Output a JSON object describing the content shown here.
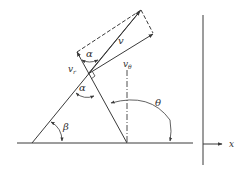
{
  "diagram": {
    "title": "",
    "colors": {
      "stroke": "#3a3a3a",
      "text": "#333333",
      "background": "#ffffff"
    },
    "labels": {
      "v": "v",
      "vr": "v",
      "vr_sub": "r",
      "vtheta": "v",
      "vtheta_sub": "θ",
      "alpha_top": "α",
      "alpha_mid": "α",
      "theta": "θ",
      "beta": "β",
      "x": "x"
    },
    "elements": [
      "ground-line",
      "inclined-line-beta",
      "radial-line",
      "velocity-v",
      "velocity-vr",
      "velocity-vtheta",
      "dashed-parallelogram",
      "vertical-dashdot-line",
      "right-angle-marker",
      "angle-arc-alpha-top",
      "angle-arc-alpha-mid",
      "angle-arc-theta",
      "angle-arc-beta",
      "vertical-axis-line",
      "x-axis-arrow"
    ]
  }
}
